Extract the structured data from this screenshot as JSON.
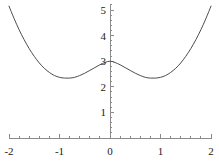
{
  "chart_data": {
    "type": "line",
    "title": "",
    "subtitle": "",
    "xlabel": "",
    "ylabel": "",
    "xlim": [
      -2,
      2
    ],
    "ylim": [
      0,
      5.2
    ],
    "grid": false,
    "legend": null,
    "axis_style": "mathematica-crossed-axes",
    "x_axis_position": 0,
    "y_axis_position": 0,
    "xticks": [
      -2,
      -1,
      0,
      1,
      2
    ],
    "xticklabels": [
      "-2",
      "-1",
      "0",
      "1",
      "2"
    ],
    "x_minor_tick_step": 0.2,
    "yticks": [
      1,
      2,
      3,
      4,
      5
    ],
    "yticklabels": [
      "1",
      "2",
      "3",
      "4",
      "5"
    ],
    "y_minor_tick_step": 0.2,
    "series": [
      {
        "name": "curve",
        "color": "#4d4d4d",
        "linewidth": 1,
        "x": [
          -2.0,
          -1.9,
          -1.8,
          -1.7,
          -1.6,
          -1.5,
          -1.4,
          -1.3,
          -1.2,
          -1.1,
          -1.0,
          -0.9,
          -0.8,
          -0.7,
          -0.6,
          -0.5,
          -0.4,
          -0.3,
          -0.2,
          -0.1,
          0.0,
          0.1,
          0.2,
          0.3,
          0.4,
          0.5,
          0.6,
          0.7,
          0.8,
          0.9,
          1.0,
          1.1,
          1.2,
          1.3,
          1.4,
          1.5,
          1.6,
          1.7,
          1.8,
          1.9,
          2.0
        ],
        "y": [
          5.15,
          4.67,
          4.23,
          3.84,
          3.49,
          3.19,
          2.93,
          2.72,
          2.56,
          2.44,
          2.37,
          2.34,
          2.34,
          2.37,
          2.44,
          2.53,
          2.64,
          2.75,
          2.86,
          2.95,
          3.0,
          2.95,
          2.86,
          2.75,
          2.64,
          2.53,
          2.44,
          2.37,
          2.34,
          2.34,
          2.37,
          2.44,
          2.56,
          2.72,
          2.93,
          3.19,
          3.49,
          3.84,
          4.23,
          4.67,
          5.15
        ],
        "annotations": {
          "local_maximum": {
            "x": 0.0,
            "y": 3.0
          },
          "local_minima": [
            {
              "x": -0.85,
              "y": 2.34
            },
            {
              "x": 0.85,
              "y": 2.34
            }
          ],
          "endpoints": [
            {
              "x": -2.0,
              "y": 5.15
            },
            {
              "x": 2.0,
              "y": 5.15
            }
          ]
        }
      }
    ],
    "colors": {
      "curve": "#4d4d4d",
      "axis": "#8c8c8c",
      "tick": "#8c8c8c",
      "label": "#1a1a1a",
      "background": "#ffffff"
    }
  }
}
